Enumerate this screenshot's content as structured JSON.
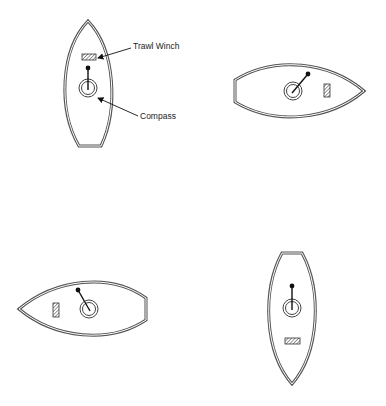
{
  "figure": {
    "labels": {
      "trawl_winch": "Trawl Winch",
      "compass": "Compass"
    },
    "boats": [
      {
        "id": "boat-1",
        "heading": "bow up",
        "needle": "points toward bow (north)"
      },
      {
        "id": "boat-2",
        "heading": "bow right",
        "needle": "points up-right"
      },
      {
        "id": "boat-3",
        "heading": "bow left",
        "needle": "points up-left"
      },
      {
        "id": "boat-4",
        "heading": "bow down",
        "needle": "points toward stern (up)"
      }
    ],
    "caption": ""
  }
}
